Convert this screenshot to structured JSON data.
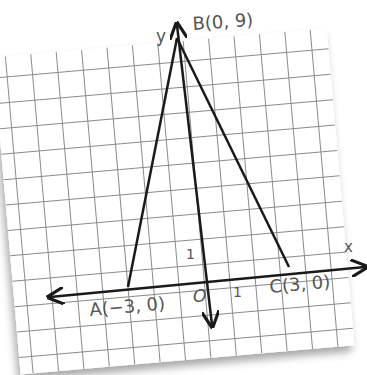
{
  "diagram": {
    "type": "coordinate-plane-triangle",
    "axes": {
      "x_label": "x",
      "y_label": "y",
      "origin_label": "O",
      "unit_x_label": "1",
      "unit_y_label": "1"
    },
    "points": [
      {
        "name": "A",
        "label": "A(−3, 0)",
        "x": -3,
        "y": 0
      },
      {
        "name": "B",
        "label": "B(0, 9)",
        "x": 0,
        "y": 9
      },
      {
        "name": "C",
        "label": "C(3, 0)",
        "x": 3,
        "y": 0
      }
    ],
    "segments": [
      [
        "A",
        "B"
      ],
      [
        "B",
        "C"
      ],
      [
        "B",
        "O"
      ]
    ],
    "colors": {
      "paper": "#ffffff",
      "grid": "#8a8a8a",
      "ink": "#1a1a1a",
      "label": "#555555"
    }
  }
}
